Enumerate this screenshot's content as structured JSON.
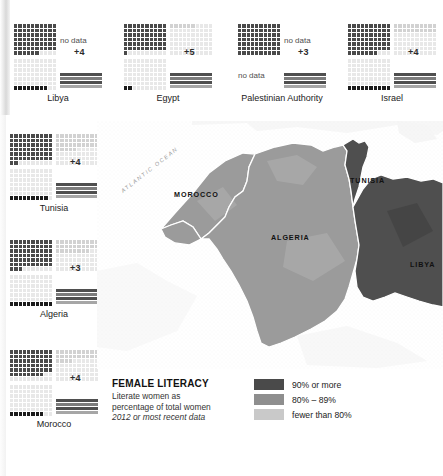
{
  "chart_data": {
    "type": "table",
    "title": "FEMALE LITERACY",
    "subtitle_lines": [
      "Literate women as",
      "percentage of total women",
      "2012 or most recent data"
    ],
    "legend": {
      "position": "bottom-right",
      "entries": [
        {
          "label": "90% or more",
          "color": "#4a4a4a"
        },
        {
          "label": "80% – 89%",
          "color": "#8e8e8e"
        },
        {
          "label": "fewer than 80%",
          "color": "#c9c9c9"
        }
      ]
    },
    "panel_legend": {
      "top_left": "female literacy rate",
      "top_right": "male literacy rate",
      "bottom_left": "youth literacy",
      "bottom_right": "literacy gap bars"
    },
    "categories": [
      "Libya",
      "Egypt",
      "Palestinian Authority",
      "Israel",
      "Tunisia",
      "Algeria",
      "Morocco"
    ],
    "series": [
      {
        "name": "gap",
        "values": [
          4,
          5,
          3,
          4,
          4,
          3,
          4
        ]
      }
    ],
    "countries": [
      {
        "name": "Libya",
        "quad_tl": {
          "type": "grid",
          "filled": 66,
          "total": 70,
          "shade": "dark"
        },
        "quad_tr": {
          "type": "text",
          "text": "no data"
        },
        "quad_bl": {
          "type": "grid",
          "filled": 0,
          "total": 70,
          "shade": "light"
        },
        "quad_bl_strip": {
          "filled": 8,
          "total": 10
        },
        "quad_br": {
          "type": "bars",
          "plus": "+4",
          "lines": 4
        }
      },
      {
        "name": "Egypt",
        "quad_tl": {
          "type": "grid",
          "filled": 61,
          "total": 70,
          "shade": "dark"
        },
        "quad_tr": {
          "type": "grid",
          "filled": 6,
          "total": 70,
          "shade": "light"
        },
        "quad_bl": {
          "type": "grid",
          "filled": 0,
          "total": 70,
          "shade": "light"
        },
        "quad_bl_strip": {
          "filled": 2,
          "total": 10
        },
        "quad_br": {
          "type": "bars",
          "plus": "+5",
          "lines": 4
        }
      },
      {
        "name": "Palestinian Authority",
        "quad_tl": {
          "type": "grid",
          "filled": 70,
          "total": 70,
          "shade": "dark"
        },
        "quad_tr": {
          "type": "text",
          "text": "no data"
        },
        "quad_bl": {
          "type": "text",
          "text": "no data"
        },
        "quad_bl_strip": {
          "filled": 0,
          "total": 10
        },
        "quad_br": {
          "type": "bars",
          "plus": "+3",
          "lines": 4
        }
      },
      {
        "name": "Israel",
        "quad_tl": {
          "type": "grid",
          "filled": 67,
          "total": 70,
          "shade": "dark"
        },
        "quad_tr": {
          "type": "grid",
          "filled": 20,
          "total": 70,
          "shade": "light"
        },
        "quad_bl": {
          "type": "grid",
          "filled": 0,
          "total": 70,
          "shade": "light"
        },
        "quad_bl_strip": {
          "filled": 10,
          "total": 10
        },
        "quad_br": {
          "type": "bars",
          "plus": "+4",
          "lines": 4
        }
      },
      {
        "name": "Tunisia",
        "quad_tl": {
          "type": "grid",
          "filled": 62,
          "total": 70,
          "shade": "dark"
        },
        "quad_tr": {
          "type": "grid",
          "filled": 35,
          "total": 70,
          "shade": "light"
        },
        "quad_bl": {
          "type": "grid",
          "filled": 0,
          "total": 70,
          "shade": "light"
        },
        "quad_bl_strip": {
          "filled": 9,
          "total": 10
        },
        "quad_br": {
          "type": "bars",
          "plus": "+4",
          "lines": 4
        }
      },
      {
        "name": "Algeria",
        "quad_tl": {
          "type": "grid",
          "filled": 63,
          "total": 70,
          "shade": "dark"
        },
        "quad_tr": {
          "type": "grid",
          "filled": 28,
          "total": 70,
          "shade": "light"
        },
        "quad_bl": {
          "type": "grid",
          "filled": 0,
          "total": 70,
          "shade": "light"
        },
        "quad_bl_strip": {
          "filled": 10,
          "total": 10
        },
        "quad_br": {
          "type": "bars",
          "plus": "+3",
          "lines": 4
        }
      },
      {
        "name": "Morocco",
        "quad_tl": {
          "type": "grid",
          "filled": 58,
          "total": 70,
          "shade": "dark"
        },
        "quad_tr": {
          "type": "grid",
          "filled": 24,
          "total": 70,
          "shade": "light"
        },
        "quad_bl": {
          "type": "grid",
          "filled": 0,
          "total": 70,
          "shade": "light"
        },
        "quad_bl_strip": {
          "filled": 8,
          "total": 10
        },
        "quad_br": {
          "type": "bars",
          "plus": "+4",
          "lines": 4
        }
      }
    ],
    "map": {
      "ocean_label": "ATLANTIC OCEAN",
      "regions": [
        {
          "name": "MOROCCO",
          "category": "80% – 89%",
          "color": "#9b9b9b"
        },
        {
          "name": "ALGERIA",
          "category": "80% – 89%",
          "color": "#9b9b9b"
        },
        {
          "name": "TUNISIA",
          "category": "90% or more",
          "color": "#4f4f4f"
        },
        {
          "name": "LIBYA",
          "category": "90% or more",
          "color": "#4f4f4f"
        }
      ]
    }
  }
}
